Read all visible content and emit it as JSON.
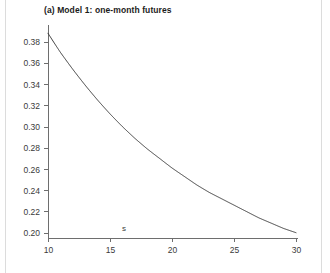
{
  "figure": {
    "title": "(a) Model 1: one-month futures"
  },
  "chart_data": {
    "type": "line",
    "title": "(a) Model 1: one-month futures",
    "xlabel": "s",
    "ylabel": "",
    "xlim": [
      10,
      30
    ],
    "ylim": [
      0.195,
      0.392
    ],
    "grid": false,
    "legend": null,
    "line_color": "#3c3c3c",
    "xticks": [
      10,
      15,
      20,
      25,
      30
    ],
    "xtick_labels": [
      "10",
      "15",
      "20",
      "25",
      "30"
    ],
    "yticks": [
      0.2,
      0.22,
      0.24,
      0.26,
      0.28,
      0.3,
      0.32,
      0.34,
      0.36,
      0.38
    ],
    "ytick_labels": [
      "0.20",
      "0.22",
      "0.24",
      "0.26",
      "0.28",
      "0.30",
      "0.32",
      "0.34",
      "0.36",
      "0.38"
    ],
    "series": [
      {
        "name": "one-month futures volatility",
        "x": [
          10,
          11,
          12,
          13,
          14,
          15,
          16,
          17,
          18,
          19,
          20,
          21,
          22,
          23,
          24,
          25,
          26,
          27,
          28,
          29,
          30
        ],
        "y": [
          0.388,
          0.37,
          0.354,
          0.339,
          0.325,
          0.312,
          0.3,
          0.289,
          0.279,
          0.27,
          0.261,
          0.253,
          0.245,
          0.238,
          0.232,
          0.226,
          0.22,
          0.214,
          0.209,
          0.204,
          0.2
        ]
      }
    ]
  }
}
